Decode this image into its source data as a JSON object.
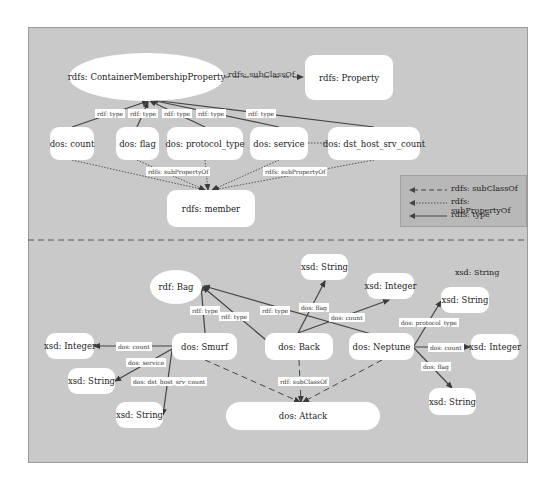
{
  "diagram": {
    "top_section": {
      "nodes": {
        "container_membership_property": "rdfs: ContainerMembershipProperty",
        "property": "rdfs: Property",
        "count": "dos: count",
        "flag": "dos: flag",
        "protocol_type": "dos: protocol_type",
        "service": "dos: service",
        "dst_host_srv_count": "dos: dst_host_srv_count",
        "member": "rdfs: member"
      },
      "edge_labels": {
        "subclassof": "rdfs: subClassOf",
        "type_count": "rdf: type",
        "type_flag": "rdf: type",
        "type_protocol": "rdf: type",
        "type_service": "rdf: type",
        "type_dst": "rdf: type",
        "subprop_left": "rdfs: subPropertyOf",
        "subprop_right": "rdfs: subPropertyOf"
      }
    },
    "legend": {
      "items": [
        {
          "style": "dashed",
          "label": "rdfs: subClassOf"
        },
        {
          "style": "dotted",
          "label": "rdfs: subPropertyOf"
        },
        {
          "style": "solid",
          "label": "rdfs: type"
        }
      ]
    },
    "bottom_section": {
      "nodes": {
        "bag": "rdf: Bag",
        "string_top": "xsd: String",
        "integer_top": "xsd: Integer",
        "string_float_label": "xsd: String",
        "string_right_top": "xsd: String",
        "integer_left": "xsd: Integer",
        "smurf": "dos: Smurf",
        "back": "dos: Back",
        "neptune": "dos: Neptune",
        "integer_right": "xsd: Integer",
        "string_left": "xsd: String",
        "string_bottom_left": "xsd: String",
        "string_right_bottom": "xsd: String",
        "attack": "dos: Attack"
      },
      "edge_labels": {
        "smurf_type": "rdf: type",
        "back_type": "rdf: type",
        "neptune_type": "rdf: type",
        "back_flag": "dos: flag",
        "back_count": "dos: count",
        "smurf_count": "dos: count",
        "smurf_service": "dos: service",
        "smurf_dst": "dos: dst_host_srv_count",
        "neptune_protocol": "dos: protocol_type",
        "neptune_count": "dos: count",
        "neptune_flag": "dos: flag",
        "subclassof": "rdf: subClassOf"
      }
    },
    "colors": {
      "background": "#c9c9c9",
      "node_fill": "#ffffff",
      "edge": "#444444",
      "legend_fill": "#b8b8b8"
    }
  }
}
